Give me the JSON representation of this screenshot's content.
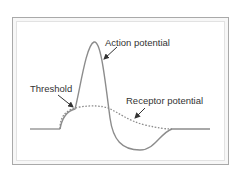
{
  "figure": {
    "type": "neuron-potential-diagram",
    "labels": {
      "action_potential": "Action potential",
      "threshold": "Threshold",
      "receptor_potential": "Receptor potential"
    },
    "colors": {
      "frame_border": "#a9a9a9",
      "curve": "#8c8c8c",
      "dotted_curve": "#8c8c8c",
      "arrow": "#333333",
      "text": "#333333"
    },
    "series": [
      {
        "name": "Action potential",
        "style": "solid"
      },
      {
        "name": "Receptor potential",
        "style": "dotted"
      }
    ]
  }
}
